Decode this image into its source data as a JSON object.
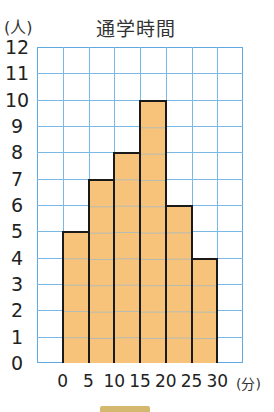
{
  "chart_data": {
    "type": "bar",
    "subtype": "histogram",
    "title": "通学時間",
    "xlabel": "(分)",
    "ylabel": "(人)",
    "bin_edges": [
      0,
      5,
      10,
      15,
      20,
      25,
      30
    ],
    "categories": [
      "0-5",
      "5-10",
      "10-15",
      "15-20",
      "20-25",
      "25-30"
    ],
    "values": [
      5,
      7,
      8,
      10,
      6,
      4
    ],
    "ylim": [
      0,
      12
    ],
    "yticks": [
      "0",
      "1",
      "2",
      "3",
      "4",
      "5",
      "6",
      "7",
      "8",
      "9",
      "10",
      "11",
      "12"
    ],
    "xticks": [
      "0",
      "5",
      "10",
      "15",
      "20",
      "25",
      "30"
    ],
    "grid": true,
    "grid_columns": 8,
    "grid_rows": 12,
    "colors": {
      "bar_fill": "#f7c27a",
      "bar_edge": "#1a1a1a",
      "grid": "#7ab8e6"
    }
  }
}
